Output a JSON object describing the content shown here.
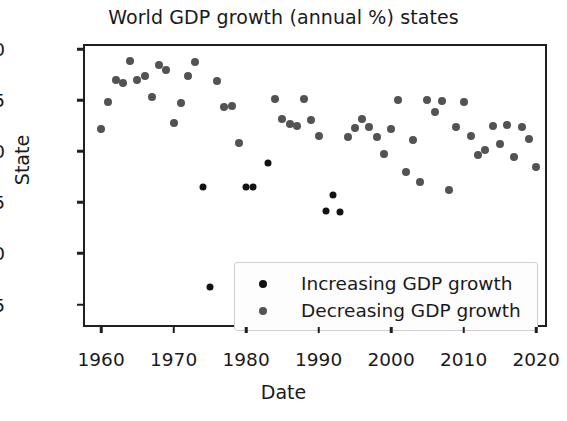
{
  "chart_data": {
    "type": "scatter",
    "title": "World GDP growth (annual %) states",
    "xlabel": "Date",
    "ylabel": "State",
    "xlim": [
      1957.5,
      2021.5
    ],
    "ylim": [
      -0.72,
      2.05
    ],
    "xticks": [
      1960,
      1970,
      1980,
      1990,
      2000,
      2010,
      2020
    ],
    "xtick_labels": [
      "1960",
      "1970",
      "1980",
      "1990",
      "2000",
      "2010",
      "2020"
    ],
    "yticks": [
      -0.5,
      0.0,
      0.5,
      1.0,
      1.5,
      2.0
    ],
    "ytick_labels": [
      "-0.5",
      "0.0",
      "0.5",
      "1.0",
      "1.5",
      "2.0"
    ],
    "grid": false,
    "legend_position": "lower right",
    "series": [
      {
        "name": "Increasing GDP growth",
        "color": "#121212",
        "marker": "circle",
        "marker_size": 5,
        "points": [
          {
            "x": 1974,
            "y": 0.65
          },
          {
            "x": 1975,
            "y": -0.33
          },
          {
            "x": 1980,
            "y": 0.65
          },
          {
            "x": 1981,
            "y": 0.65
          },
          {
            "x": 1983,
            "y": 0.89
          },
          {
            "x": 1991,
            "y": 0.42
          },
          {
            "x": 1992,
            "y": 0.57
          },
          {
            "x": 1993,
            "y": 0.41
          }
        ]
      },
      {
        "name": "Decreasing GDP growth",
        "color": "#535353",
        "marker": "circle",
        "marker_size": 6,
        "points": [
          {
            "x": 1960,
            "y": 1.22
          },
          {
            "x": 1961,
            "y": 1.48
          },
          {
            "x": 1962,
            "y": 1.7
          },
          {
            "x": 1963,
            "y": 1.67
          },
          {
            "x": 1964,
            "y": 1.88
          },
          {
            "x": 1965,
            "y": 1.7
          },
          {
            "x": 1966,
            "y": 1.74
          },
          {
            "x": 1967,
            "y": 1.53
          },
          {
            "x": 1968,
            "y": 1.84
          },
          {
            "x": 1969,
            "y": 1.8
          },
          {
            "x": 1970,
            "y": 1.28
          },
          {
            "x": 1971,
            "y": 1.47
          },
          {
            "x": 1972,
            "y": 1.74
          },
          {
            "x": 1973,
            "y": 1.87
          },
          {
            "x": 1976,
            "y": 1.69
          },
          {
            "x": 1977,
            "y": 1.43
          },
          {
            "x": 1978,
            "y": 1.44
          },
          {
            "x": 1979,
            "y": 1.08
          },
          {
            "x": 1984,
            "y": 1.51
          },
          {
            "x": 1985,
            "y": 1.32
          },
          {
            "x": 1986,
            "y": 1.27
          },
          {
            "x": 1987,
            "y": 1.25
          },
          {
            "x": 1988,
            "y": 1.51
          },
          {
            "x": 1989,
            "y": 1.31
          },
          {
            "x": 1990,
            "y": 1.15
          },
          {
            "x": 1994,
            "y": 1.14
          },
          {
            "x": 1995,
            "y": 1.23
          },
          {
            "x": 1996,
            "y": 1.32
          },
          {
            "x": 1997,
            "y": 1.24
          },
          {
            "x": 1998,
            "y": 1.14
          },
          {
            "x": 1999,
            "y": 0.97
          },
          {
            "x": 2000,
            "y": 1.22
          },
          {
            "x": 2001,
            "y": 1.5
          },
          {
            "x": 2002,
            "y": 0.8
          },
          {
            "x": 2003,
            "y": 1.11
          },
          {
            "x": 2004,
            "y": 0.7
          },
          {
            "x": 2005,
            "y": 1.5
          },
          {
            "x": 2006,
            "y": 1.38
          },
          {
            "x": 2007,
            "y": 1.49
          },
          {
            "x": 2008,
            "y": 0.62
          },
          {
            "x": 2009,
            "y": 1.24
          },
          {
            "x": 2010,
            "y": 1.48
          },
          {
            "x": 2011,
            "y": 1.15
          },
          {
            "x": 2012,
            "y": 0.96
          },
          {
            "x": 2013,
            "y": 1.01
          },
          {
            "x": 2014,
            "y": 1.25
          },
          {
            "x": 2015,
            "y": 1.07
          },
          {
            "x": 2016,
            "y": 1.26
          },
          {
            "x": 2017,
            "y": 0.94
          },
          {
            "x": 2018,
            "y": 1.24
          },
          {
            "x": 2019,
            "y": 1.12
          },
          {
            "x": 2020,
            "y": 0.85
          },
          {
            "x": 1982,
            "y": -0.66
          }
        ]
      }
    ]
  },
  "legend": {
    "items": [
      {
        "label": "Increasing GDP growth",
        "color": "#121212"
      },
      {
        "label": "Decreasing GDP growth",
        "color": "#535353"
      }
    ]
  }
}
